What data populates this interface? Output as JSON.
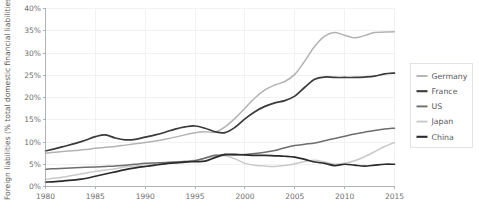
{
  "chart_data": {
    "type": "line",
    "title": "",
    "subtitle": "",
    "xlabel": "",
    "ylabel": "Foreign liabilities (% total domestic financial liabilities)",
    "xlim": [
      1980,
      2015
    ],
    "ylim": [
      0,
      40
    ],
    "grid": true,
    "legend_position": "right",
    "x_tick_labels": [
      "1980",
      "1985",
      "1990",
      "1995",
      "2000",
      "2005",
      "2010",
      "2015"
    ],
    "x_ticks": [
      1980,
      1985,
      1990,
      1995,
      2000,
      2005,
      2010,
      2015
    ],
    "y_tick_labels": [
      "0%",
      "5%",
      "10%",
      "15%",
      "20%",
      "25%",
      "30%",
      "35%",
      "40%"
    ],
    "y_ticks": [
      0,
      5,
      10,
      15,
      20,
      25,
      30,
      35,
      40
    ],
    "x": [
      1980,
      1981,
      1982,
      1983,
      1984,
      1985,
      1986,
      1987,
      1988,
      1989,
      1990,
      1991,
      1992,
      1993,
      1994,
      1995,
      1996,
      1997,
      1998,
      1999,
      2000,
      2001,
      2002,
      2003,
      2004,
      2005,
      2006,
      2007,
      2008,
      2009,
      2010,
      2011,
      2012,
      2013,
      2014,
      2015
    ],
    "series": [
      {
        "name": "Germany",
        "color": "#b3b3b3",
        "width": 1.5,
        "values": [
          7.5,
          7.7,
          7.9,
          8.1,
          8.3,
          8.6,
          8.8,
          9.0,
          9.3,
          9.6,
          9.9,
          10.2,
          10.6,
          11.1,
          11.6,
          12.1,
          12.3,
          12.2,
          13.4,
          15.3,
          17.6,
          19.9,
          21.7,
          22.8,
          23.6,
          25.2,
          28.2,
          31.5,
          33.8,
          34.6,
          34.0,
          33.4,
          33.9,
          34.6,
          34.7,
          34.8
        ]
      },
      {
        "name": "France",
        "color": "#3a3a3a",
        "width": 1.7,
        "values": [
          8.0,
          8.5,
          9.1,
          9.7,
          10.4,
          11.2,
          11.6,
          10.9,
          10.5,
          10.6,
          11.1,
          11.6,
          12.2,
          12.9,
          13.4,
          13.6,
          13.1,
          12.3,
          12.1,
          13.3,
          15.2,
          16.8,
          18.0,
          18.8,
          19.3,
          20.3,
          22.3,
          24.1,
          24.6,
          24.5,
          24.5,
          24.5,
          24.6,
          24.8,
          25.3,
          25.5
        ]
      },
      {
        "name": "US",
        "color": "#6e6e6e",
        "width": 1.5,
        "values": [
          3.9,
          4.0,
          4.1,
          4.2,
          4.3,
          4.4,
          4.5,
          4.6,
          4.8,
          5.0,
          5.2,
          5.3,
          5.4,
          5.5,
          5.6,
          5.8,
          6.4,
          7.0,
          7.1,
          7.1,
          7.2,
          7.4,
          7.7,
          8.1,
          8.7,
          9.2,
          9.5,
          9.8,
          10.3,
          10.8,
          11.3,
          11.8,
          12.2,
          12.6,
          12.9,
          13.1
        ]
      },
      {
        "name": "Japan",
        "color": "#c9c9c9",
        "width": 1.5,
        "values": [
          1.6,
          1.9,
          2.2,
          2.6,
          3.0,
          3.4,
          3.7,
          4.0,
          4.4,
          4.6,
          4.8,
          5.0,
          5.3,
          5.5,
          5.7,
          5.9,
          6.3,
          6.8,
          6.9,
          6.2,
          5.2,
          4.8,
          4.6,
          4.5,
          4.7,
          5.1,
          5.6,
          5.9,
          5.5,
          5.0,
          5.2,
          5.8,
          6.7,
          7.8,
          9.0,
          9.9
        ]
      },
      {
        "name": "China",
        "color": "#2b2b2b",
        "width": 1.7,
        "values": [
          1.0,
          1.1,
          1.3,
          1.5,
          1.8,
          2.3,
          2.8,
          3.3,
          3.8,
          4.2,
          4.5,
          4.8,
          5.1,
          5.3,
          5.5,
          5.6,
          5.7,
          6.5,
          7.2,
          7.2,
          7.1,
          7.0,
          7.0,
          6.9,
          6.8,
          6.6,
          6.1,
          5.5,
          5.2,
          4.7,
          5.0,
          4.8,
          4.6,
          4.8,
          5.0,
          5.0
        ]
      }
    ]
  },
  "legend": {
    "entries": [
      {
        "label": "Germany"
      },
      {
        "label": "France"
      },
      {
        "label": "US"
      },
      {
        "label": "Japan"
      },
      {
        "label": "China"
      }
    ]
  }
}
